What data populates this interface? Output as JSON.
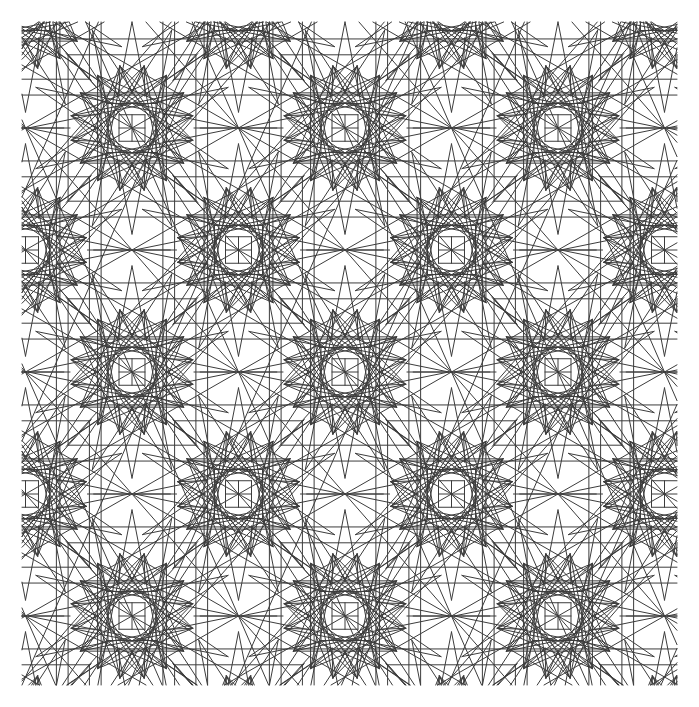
{
  "figure": {
    "kind": "line-drawing",
    "background_color": "#ffffff",
    "stroke_color": "#3c3c3c",
    "stroke_width": 1.0,
    "canvas": {
      "width": 699,
      "height": 707
    },
    "pattern_bounds": {
      "x0": 22,
      "y0": 22,
      "x1": 677,
      "y1": 685
    }
  },
  "chart_data": {
    "type": "diagram",
    "lattice": {
      "type": "centered-rectangular",
      "period_x": 213,
      "period_y": 244,
      "offset_x": 106.5,
      "offset_y": 122,
      "origin": {
        "x": 132,
        "y": 128
      }
    },
    "motif": {
      "name": "16-point-rosette",
      "points": 16,
      "outer_radius": 104,
      "star_radius": 62,
      "core_square_half": 13,
      "inner_ring_radius": 34,
      "features": [
        "central small square with cross",
        "eight-point inner star",
        "sixteen-point outer rosette",
        "bounding square frame",
        "interlaced long chords between neighbouring rosettes"
      ]
    },
    "rosette_centers": [
      {
        "x": 132,
        "y": 128
      },
      {
        "x": 345,
        "y": 128
      },
      {
        "x": 568,
        "y": 128
      },
      {
        "x": 240,
        "y": 250
      },
      {
        "x": 460,
        "y": 250
      },
      {
        "x": 22,
        "y": 250
      },
      {
        "x": 676,
        "y": 250
      },
      {
        "x": 132,
        "y": 350
      },
      {
        "x": 345,
        "y": 350
      },
      {
        "x": 568,
        "y": 350
      },
      {
        "x": 240,
        "y": 462
      },
      {
        "x": 460,
        "y": 462
      },
      {
        "x": 22,
        "y": 462
      },
      {
        "x": 676,
        "y": 462
      },
      {
        "x": 132,
        "y": 573
      },
      {
        "x": 345,
        "y": 573
      },
      {
        "x": 568,
        "y": 573
      },
      {
        "x": 240,
        "y": 40
      },
      {
        "x": 460,
        "y": 40
      },
      {
        "x": 240,
        "y": 684
      },
      {
        "x": 460,
        "y": 684
      },
      {
        "x": 22,
        "y": 40
      },
      {
        "x": 676,
        "y": 40
      },
      {
        "x": 22,
        "y": 684
      },
      {
        "x": 676,
        "y": 684
      },
      {
        "x": 22,
        "y": 128
      },
      {
        "x": 676,
        "y": 128
      },
      {
        "x": 22,
        "y": 350
      },
      {
        "x": 676,
        "y": 350
      },
      {
        "x": 22,
        "y": 573
      },
      {
        "x": 676,
        "y": 573
      }
    ],
    "counts": {
      "rosettes_visible": 31,
      "approx_line_segments": 2100
    },
    "xlabel": "",
    "ylabel": "",
    "grid": false,
    "legend": null
  }
}
